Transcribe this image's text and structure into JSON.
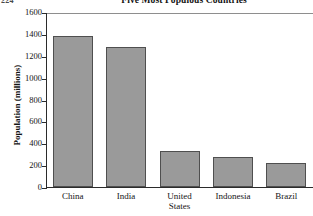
{
  "corner_fragment": "224",
  "chart_data": {
    "type": "bar",
    "title": "Five Most Populous Countries",
    "xlabel": "",
    "ylabel": "Population (millions)",
    "categories": [
      "China",
      "India",
      "United States",
      "Indonesia",
      "Brazil"
    ],
    "category_lines": [
      [
        "China"
      ],
      [
        "India"
      ],
      [
        "United",
        "States"
      ],
      [
        "Indonesia"
      ],
      [
        "Brazil"
      ]
    ],
    "values": [
      1380,
      1280,
      330,
      270,
      220
    ],
    "ylim": [
      0,
      1600
    ],
    "ytick_step": 200,
    "ytick_labels": [
      "0",
      "200",
      "400",
      "600",
      "800",
      "1000",
      "1200",
      "1400",
      "1600"
    ],
    "grid": false,
    "legend": null,
    "bar_fill_color": "#9a9a9a",
    "bar_border_color": "#4f4f4f",
    "axis_color": "#2b2b2b"
  }
}
